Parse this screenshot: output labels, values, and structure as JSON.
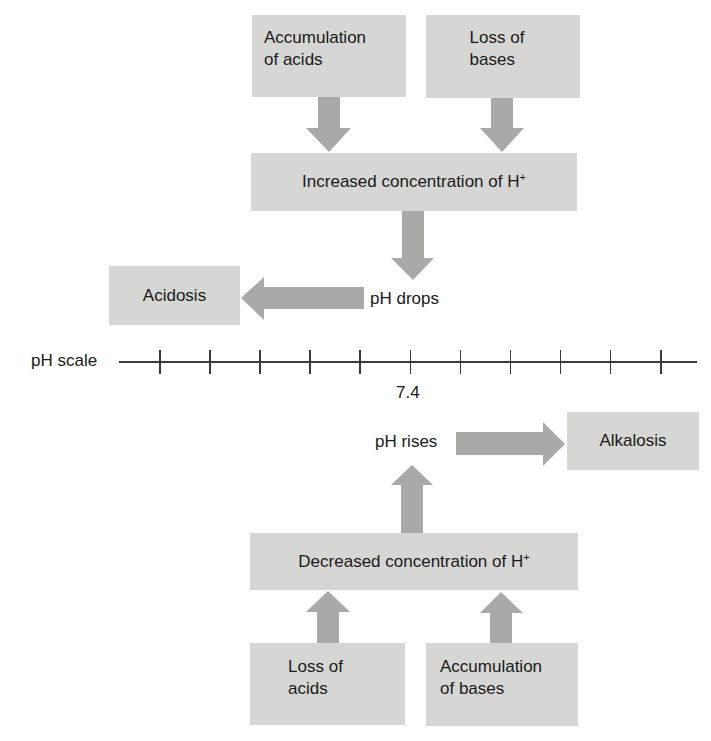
{
  "diagram": {
    "colors": {
      "box": "#d6d6d4",
      "arrow": "#a9a9a7",
      "line": "#3a3a3a",
      "text": "#1a1a1a"
    },
    "top_causes": [
      {
        "line1": "Accumulation",
        "line2": "of acids"
      },
      {
        "line1": "Loss of",
        "line2": "bases"
      }
    ],
    "increased": {
      "text": "Increased concentration of H",
      "sup": "+"
    },
    "ph_drops": "pH drops",
    "acidosis": "Acidosis",
    "scale": {
      "label": "pH scale",
      "tick_count": 11,
      "marker_value": "7.4"
    },
    "ph_rises": "pH rises",
    "alkalosis": "Alkalosis",
    "decreased": {
      "text": "Decreased concentration of H",
      "sup": "+"
    },
    "bottom_causes": [
      {
        "line1": "Loss of",
        "line2": "acids"
      },
      {
        "line1": "Accumulation",
        "line2": "of bases"
      }
    ]
  }
}
